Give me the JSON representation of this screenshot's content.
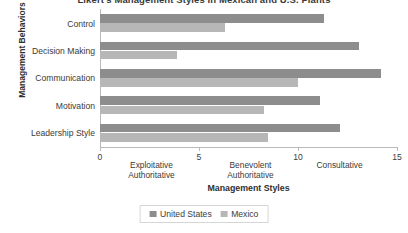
{
  "chart_data": {
    "type": "bar",
    "orientation": "horizontal",
    "title": "Likert's Management Styles in Mexican and U.S. Plants",
    "xlabel": "Management Styles",
    "ylabel": "Management Behaviors",
    "categories": [
      "Control",
      "Decision Making",
      "Communication",
      "Motivation",
      "Leadership Style"
    ],
    "series": [
      {
        "name": "United States",
        "color": "#8d8d8d",
        "values": [
          11.3,
          13.1,
          14.2,
          11.1,
          12.1
        ]
      },
      {
        "name": "Mexico",
        "color": "#b7b7b7",
        "values": [
          6.3,
          3.9,
          10.0,
          8.3,
          8.5
        ]
      }
    ],
    "xlim": [
      0,
      15
    ],
    "xticks": [
      "0",
      "5",
      "10",
      "15"
    ],
    "xtick_values": [
      0,
      5,
      10,
      15
    ],
    "style_bands": [
      {
        "line1": "Exploitative",
        "line2": "Authoritative",
        "center": 2.6
      },
      {
        "line1": "Benevolent",
        "line2": "Authoritative",
        "center": 7.6
      },
      {
        "line1": "Consultative",
        "line2": "",
        "center": 12.1
      }
    ],
    "grid": false,
    "legend_position": "bottom"
  }
}
